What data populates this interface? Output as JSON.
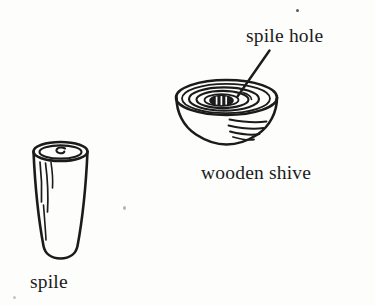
{
  "figure": {
    "background_color": "#fdfdfc",
    "ink_color": "#1b1b1b",
    "width": 375,
    "height": 305,
    "labels": {
      "spile_hole": "spile hole",
      "wooden_shive": "wooden shive",
      "spile": "spile"
    },
    "parts": [
      {
        "id": "spile",
        "name": "spile",
        "label": "spile",
        "description": "tapered wooden peg drawn as a vertical cylinder with an elliptical top face, a small spiral mark at the centre of the top, and wavy grain lines down the left of the body"
      },
      {
        "id": "wooden-shive",
        "name": "wooden shive",
        "label": "wooden shive",
        "description": "round wooden disc drawn in three-quarter view with concentric rings on its top face and curved shading lines on its lower right side"
      },
      {
        "id": "spile-hole",
        "name": "spile hole",
        "label": "spile hole",
        "description": "small dark hatched opening at the centre of the wooden shive, called out by a diagonal leader line"
      }
    ],
    "leader_line": {
      "from_label": "spile hole",
      "to_part": "spile-hole"
    }
  }
}
